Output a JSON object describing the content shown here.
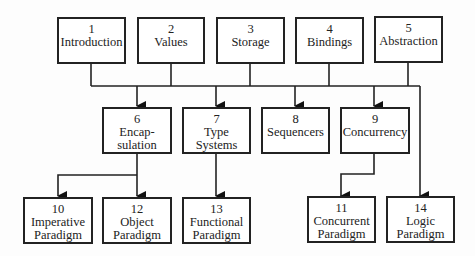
{
  "diagram": {
    "nodes": [
      {
        "id": "1",
        "num": "1",
        "lines": [
          "Introduction"
        ]
      },
      {
        "id": "2",
        "num": "2",
        "lines": [
          "Values"
        ]
      },
      {
        "id": "3",
        "num": "3",
        "lines": [
          "Storage"
        ]
      },
      {
        "id": "4",
        "num": "4",
        "lines": [
          "Bindings"
        ]
      },
      {
        "id": "5",
        "num": "5",
        "lines": [
          "Abstraction"
        ]
      },
      {
        "id": "6",
        "num": "6",
        "lines": [
          "Encap-",
          "sulation"
        ]
      },
      {
        "id": "7",
        "num": "7",
        "lines": [
          "Type",
          "Systems"
        ]
      },
      {
        "id": "8",
        "num": "8",
        "lines": [
          "Sequencers"
        ]
      },
      {
        "id": "9",
        "num": "9",
        "lines": [
          "Concurrency"
        ]
      },
      {
        "id": "10",
        "num": "10",
        "lines": [
          "Imperative",
          "Paradigm"
        ]
      },
      {
        "id": "12",
        "num": "12",
        "lines": [
          "Object",
          "Paradigm"
        ]
      },
      {
        "id": "13",
        "num": "13",
        "lines": [
          "Functional",
          "Paradigm"
        ]
      },
      {
        "id": "11",
        "num": "11",
        "lines": [
          "Concurrent",
          "Paradigm"
        ]
      },
      {
        "id": "14",
        "num": "14",
        "lines": [
          "Logic",
          "Paradigm"
        ]
      }
    ],
    "edges": [
      {
        "from": [
          "1",
          "2",
          "3",
          "4",
          "5"
        ],
        "to": [
          "6",
          "7",
          "8",
          "9",
          "14"
        ]
      },
      {
        "from": "6",
        "to": "10"
      },
      {
        "from": "6",
        "to": "12"
      },
      {
        "from": "7",
        "to": "13"
      },
      {
        "from": "9",
        "to": "11"
      }
    ]
  }
}
